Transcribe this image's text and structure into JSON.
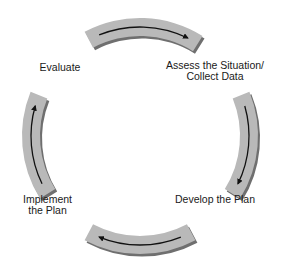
{
  "diagram": {
    "type": "cycle",
    "direction": "clockwise",
    "colors": {
      "arc_fill": "#b9b9b9",
      "arc_shadow": "#6f6f6f",
      "arrow": "#111111",
      "text": "#1a1a1a"
    },
    "steps": [
      {
        "id": "assess",
        "label": "Assess the Situation/\nCollect Data"
      },
      {
        "id": "develop",
        "label": "Develop the Plan"
      },
      {
        "id": "implement",
        "label": "Implement\nthe Plan"
      },
      {
        "id": "evaluate",
        "label": "Evaluate"
      }
    ],
    "arrows": [
      {
        "from": "evaluate",
        "to": "assess"
      },
      {
        "from": "assess",
        "to": "develop"
      },
      {
        "from": "develop",
        "to": "implement"
      },
      {
        "from": "implement",
        "to": "evaluate"
      }
    ]
  }
}
